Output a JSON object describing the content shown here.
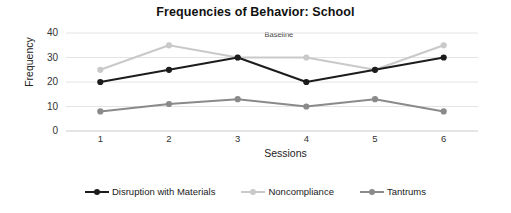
{
  "chart_data": {
    "type": "line",
    "title": "Frequencies of Behavior: School",
    "xlabel": "Sessions",
    "ylabel": "Frequency",
    "x": [
      1,
      2,
      3,
      4,
      5,
      6
    ],
    "categories": [
      "1",
      "2",
      "3",
      "4",
      "5",
      "6"
    ],
    "xtick_labels": [
      "1",
      "2",
      "3",
      "4",
      "5",
      "6"
    ],
    "ytick_labels": [
      "0",
      "10",
      "20",
      "30",
      "40"
    ],
    "yticks": [
      0,
      10,
      20,
      30,
      40
    ],
    "ylim": [
      0,
      40
    ],
    "xlim": [
      0.5,
      6.5
    ],
    "grid": "horizontal",
    "legend_position": "bottom",
    "annotations": [
      {
        "text": "Baseline",
        "x": 3.6,
        "y": 39
      }
    ],
    "series": [
      {
        "name": "Disruption with Materials",
        "color": "#1c1c1c",
        "values": [
          20,
          25,
          30,
          20,
          25,
          30
        ]
      },
      {
        "name": "Noncompliance",
        "color": "#c9c9c9",
        "values": [
          25,
          35,
          30,
          30,
          25,
          35
        ]
      },
      {
        "name": "Tantrums",
        "color": "#8a8a8a",
        "values": [
          8,
          11,
          13,
          10,
          13,
          8
        ]
      }
    ]
  }
}
